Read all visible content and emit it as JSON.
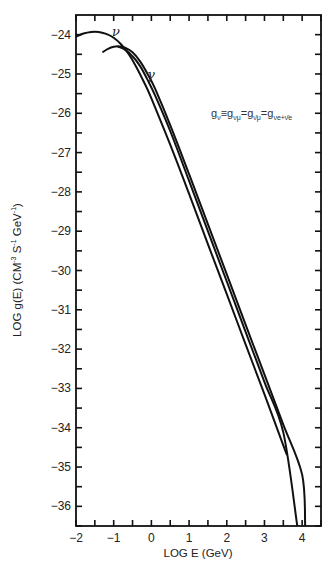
{
  "chart_data": {
    "type": "line",
    "title": "",
    "xlabel": "LOG E (GeV)",
    "ylabel": "LOG g(E) (CM-3 S-1 GeV-1)",
    "ylabel_parts": {
      "main": "LOG g(E) (CM",
      "sup1": "-3",
      "mid1": " S",
      "sup2": "-1",
      "mid2": " GeV",
      "sup3": "-1",
      "end": ")"
    },
    "xlim": [
      -2,
      4.5
    ],
    "ylim": [
      -36.5,
      -23.5
    ],
    "x_ticks": [
      -2,
      -1,
      0,
      1,
      2,
      3,
      4
    ],
    "x_tick_labels": [
      "−2",
      "−1",
      "0",
      "1",
      "2",
      "3",
      "4"
    ],
    "x_minor_step": 0.5,
    "y_ticks": [
      -24,
      -25,
      -26,
      -27,
      -28,
      -29,
      -30,
      -31,
      -32,
      -33,
      -34,
      -35,
      -36
    ],
    "y_tick_labels": [
      "−24",
      "−25",
      "−26",
      "−27",
      "−28",
      "−29",
      "−30",
      "−31",
      "−32",
      "−33",
      "−34",
      "−35",
      "−36"
    ],
    "y_minor_step": 0.5,
    "grid": false,
    "legend": null,
    "annotations": [
      {
        "text": "ν",
        "x": -0.9,
        "y": -23.98
      },
      {
        "text": "γ",
        "x": 0.05,
        "y": -25.1
      },
      {
        "text": "gν≡gνμ=gν̄μ=gνe+ν̄e",
        "x": 1.3,
        "y": -26.2
      }
    ],
    "series": [
      {
        "name": "ν (neutrino)",
        "x": [
          -2.0,
          -1.8,
          -1.6,
          -1.4,
          -1.2,
          -1.0,
          -0.8,
          -0.6,
          -0.4,
          -0.2,
          0.0,
          0.5,
          1.0,
          1.5,
          2.0,
          2.5,
          3.0,
          3.5,
          3.6
        ],
        "values": [
          -24.05,
          -23.97,
          -23.93,
          -23.93,
          -23.98,
          -24.08,
          -24.25,
          -24.5,
          -24.82,
          -25.2,
          -25.62,
          -26.8,
          -28.05,
          -29.33,
          -30.6,
          -31.88,
          -33.15,
          -34.45,
          -34.7
        ]
      },
      {
        "name": "γ (photon)",
        "x": [
          -1.3,
          -1.15,
          -1.0,
          -0.85,
          -0.7,
          -0.5,
          -0.3,
          -0.1,
          0.1,
          0.5,
          1.0,
          1.5,
          2.0,
          2.5,
          3.0,
          3.5,
          4.0,
          4.08
        ],
        "values": [
          -24.45,
          -24.36,
          -24.31,
          -24.3,
          -24.33,
          -24.45,
          -24.68,
          -25.0,
          -25.38,
          -26.3,
          -27.55,
          -28.82,
          -30.1,
          -31.38,
          -32.65,
          -33.92,
          -35.2,
          -36.5
        ]
      },
      {
        "name": "third curve",
        "x": [
          -0.9,
          -0.7,
          -0.5,
          -0.3,
          -0.1,
          0.1,
          0.5,
          1.0,
          1.5,
          2.0,
          2.5,
          3.0,
          3.5,
          3.87
        ],
        "values": [
          -24.3,
          -24.38,
          -24.55,
          -24.8,
          -25.15,
          -25.55,
          -26.45,
          -27.72,
          -29.0,
          -30.28,
          -31.56,
          -32.84,
          -34.12,
          -36.5
        ]
      }
    ]
  },
  "equation": {
    "g1": "g",
    "s1": "ν",
    "eq1": "≡",
    "g2": "g",
    "s2": "νμ",
    "eq2": "=",
    "g3": "g",
    "s3": "ν̄μ",
    "eq3": "=",
    "g4": "g",
    "s4": "νe+ν̄e"
  },
  "curve_labels": {
    "nu": "ν",
    "gamma": "γ"
  }
}
